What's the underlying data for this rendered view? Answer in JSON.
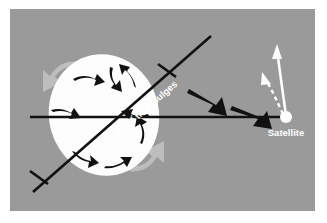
{
  "figure": {
    "name": "tidal-bulge-satellite-diagram",
    "type": "astronomy-schematic",
    "background_color": "#ffffff",
    "panel_color": "#9a9a9a",
    "panel": {
      "x": 10,
      "y": 9,
      "width": 305,
      "height": 202
    }
  },
  "labels": {
    "line_of_tidal_bulges": "Line of tidal bulges",
    "satellite": "Satellite"
  },
  "colors": {
    "panel_gray": "#9a9a9a",
    "body_white": "#fdfdfd",
    "bulge_gray": "#bdbdbd",
    "line_black": "#111111",
    "arrow_black": "#111111",
    "arrow_white": "#ffffff",
    "label_white": "#ffffff"
  },
  "elements": {
    "planet_body": {
      "name": "planet-ellipse",
      "cx": 104,
      "cy": 115,
      "rx": 55,
      "ry": 61,
      "rotation_deg": -12,
      "fill": "#fdfdfd"
    },
    "tidal_bulge_arrows": [
      {
        "id": "bulge-arrow-upper-left",
        "color": "#bdbdbd",
        "position": "upper-left"
      },
      {
        "id": "bulge-arrow-lower-right",
        "color": "#bdbdbd",
        "position": "lower-right"
      }
    ],
    "rotation_arrows_count": 8,
    "gravity_arrows": [
      {
        "id": "gravity-arrow-outer",
        "direction": "down-right"
      },
      {
        "id": "gravity-arrow-inner",
        "direction": "down-right"
      }
    ],
    "satellite_marker": {
      "cx": 286,
      "cy": 117,
      "r": 6,
      "fill": "#ffffff"
    },
    "orbit_arrows": [
      {
        "id": "orbit-arrow-solid",
        "style": "solid",
        "color": "#ffffff"
      },
      {
        "id": "orbit-arrow-dashed",
        "style": "dashed",
        "color": "#ffffff"
      }
    ],
    "horizontal_line": {
      "x1": 30,
      "y1": 117,
      "x2": 286,
      "y2": 117
    },
    "bulge_line": {
      "x1": 33,
      "y1": 192,
      "x2": 211,
      "y2": 36,
      "rotation_deg": -41
    },
    "tick_marks_count": 2
  }
}
